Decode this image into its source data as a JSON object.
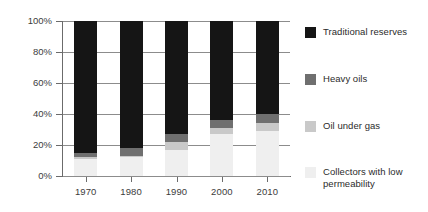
{
  "chart_data": {
    "type": "bar",
    "title": "",
    "subtitle": "",
    "xlabel": "",
    "ylabel": "",
    "stacked": true,
    "stack_mode": "percent",
    "grid": true,
    "legend_position": "right",
    "ylim": [
      0,
      100
    ],
    "yticks": [
      "0%",
      "20%",
      "40%",
      "60%",
      "80%",
      "100%"
    ],
    "ytick_values": [
      0,
      20,
      40,
      60,
      80,
      100
    ],
    "categories": [
      "1970",
      "1980",
      "1990",
      "2000",
      "2010"
    ],
    "series": [
      {
        "name": "Collectors with low\npermeability",
        "color": "#efefef",
        "values": [
          11,
          12,
          17,
          27,
          29
        ]
      },
      {
        "name": "Oil under gas",
        "color": "#c9c9c9",
        "values": [
          1,
          1,
          5,
          4,
          5
        ]
      },
      {
        "name": "Heavy oils",
        "color": "#6f6f6f",
        "values": [
          3,
          5,
          5,
          5,
          6
        ]
      },
      {
        "name": "Traditional reserves",
        "color": "#151515",
        "values": [
          85,
          82,
          73,
          64,
          60
        ]
      }
    ]
  },
  "legend": {
    "items": [
      {
        "label": "Traditional reserves",
        "color": "#151515"
      },
      {
        "label": "Heavy oils",
        "color": "#6f6f6f"
      },
      {
        "label": "Oil under gas",
        "color": "#c9c9c9"
      },
      {
        "label": "Collectors with low\npermeability",
        "color": "#efefef"
      }
    ]
  },
  "axes": {
    "y_tick_labels": [
      "100%",
      "80%",
      "60%",
      "40%",
      "20%",
      "0%"
    ],
    "x_tick_labels": [
      "1970",
      "1980",
      "1990",
      "2000",
      "2010"
    ]
  },
  "colors": {
    "grid": "#8c8c8c",
    "axis": "#6b6b6b",
    "text": "#3c3c3c",
    "background": "#ffffff"
  }
}
